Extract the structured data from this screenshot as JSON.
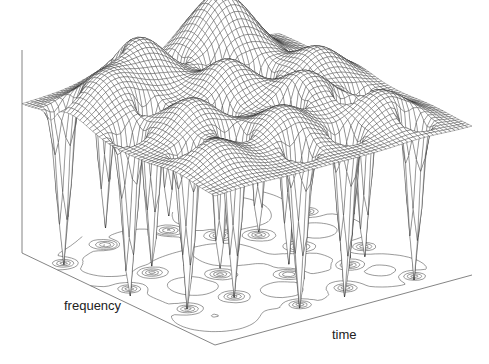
{
  "chart_data": {
    "type": "surface3d",
    "title": "",
    "xlabel": "time",
    "ylabel": "frequency",
    "zlabel": "",
    "grid": false,
    "legend": null,
    "colors": {
      "mesh": "#2a2a2a",
      "contour": "#555555",
      "axis": "#666666",
      "background": "#ffffff"
    },
    "grid_resolution": {
      "time": 60,
      "frequency": 60
    },
    "surface_bumps": [
      {
        "t": 0.15,
        "f": 0.75,
        "amp": 0.55,
        "w": 0.14
      },
      {
        "t": 0.35,
        "f": 0.85,
        "amp": 0.7,
        "w": 0.13
      },
      {
        "t": 0.7,
        "f": 0.9,
        "amp": 0.95,
        "w": 0.15
      },
      {
        "t": 0.5,
        "f": 0.6,
        "amp": 0.6,
        "w": 0.12
      },
      {
        "t": 0.25,
        "f": 0.45,
        "amp": 0.5,
        "w": 0.12
      },
      {
        "t": 0.65,
        "f": 0.4,
        "amp": 0.55,
        "w": 0.12
      },
      {
        "t": 0.85,
        "f": 0.6,
        "amp": 0.45,
        "w": 0.12
      },
      {
        "t": 0.45,
        "f": 0.25,
        "amp": 0.45,
        "w": 0.12
      },
      {
        "t": 0.8,
        "f": 0.2,
        "amp": 0.4,
        "w": 0.12
      },
      {
        "t": 0.15,
        "f": 0.2,
        "amp": 0.35,
        "w": 0.12
      }
    ],
    "zeros": [
      {
        "t": 0.08,
        "f": 0.55
      },
      {
        "t": 0.12,
        "f": 0.3
      },
      {
        "t": 0.22,
        "f": 0.62
      },
      {
        "t": 0.3,
        "f": 0.3
      },
      {
        "t": 0.38,
        "f": 0.48
      },
      {
        "t": 0.42,
        "f": 0.12
      },
      {
        "t": 0.55,
        "f": 0.35
      },
      {
        "t": 0.58,
        "f": 0.75
      },
      {
        "t": 0.62,
        "f": 0.15
      },
      {
        "t": 0.72,
        "f": 0.52
      },
      {
        "t": 0.75,
        "f": 0.3
      },
      {
        "t": 0.88,
        "f": 0.4
      },
      {
        "t": 0.92,
        "f": 0.75
      },
      {
        "t": 0.48,
        "f": 0.88
      },
      {
        "t": 0.25,
        "f": 0.9
      },
      {
        "t": 0.85,
        "f": 0.1
      },
      {
        "t": 0.05,
        "f": 0.85
      },
      {
        "t": 0.68,
        "f": 0.68
      }
    ],
    "projection": {
      "floor_left": [
        22,
        253
      ],
      "floor_front": [
        215,
        345
      ],
      "floor_right": [
        472,
        275
      ],
      "z_axis_top": [
        22,
        50
      ],
      "surface_base_height_px": 130,
      "z_scale_px": 75
    }
  },
  "axes": {
    "time_label": "time",
    "frequency_label": "frequency"
  }
}
